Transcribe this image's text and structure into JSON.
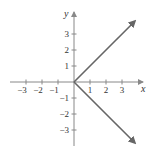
{
  "chart_data": {
    "type": "line",
    "title": "",
    "xlabel": "x",
    "ylabel": "y",
    "xlim": [
      -3.5,
      4.3
    ],
    "ylim": [
      -3.9,
      4.5
    ],
    "grid": false,
    "x_ticks": [
      -3,
      -2,
      -1,
      1,
      2,
      3
    ],
    "y_ticks": [
      -3,
      -2,
      -1,
      1,
      2,
      3
    ],
    "x_tick_labels": [
      "−3",
      "−2",
      "−1",
      "1",
      "2",
      "3"
    ],
    "y_tick_labels": [
      "−3",
      "−2",
      "−1",
      "1",
      "2",
      "3"
    ],
    "series": [
      {
        "name": "upper ray",
        "x": [
          0,
          3.8
        ],
        "y": [
          0,
          3.8
        ],
        "arrow_end": true
      },
      {
        "name": "lower ray",
        "x": [
          0,
          3.8
        ],
        "y": [
          0,
          -3.8
        ],
        "arrow_end": true
      }
    ],
    "line_color": "#666666",
    "axis_color": "#888888"
  }
}
